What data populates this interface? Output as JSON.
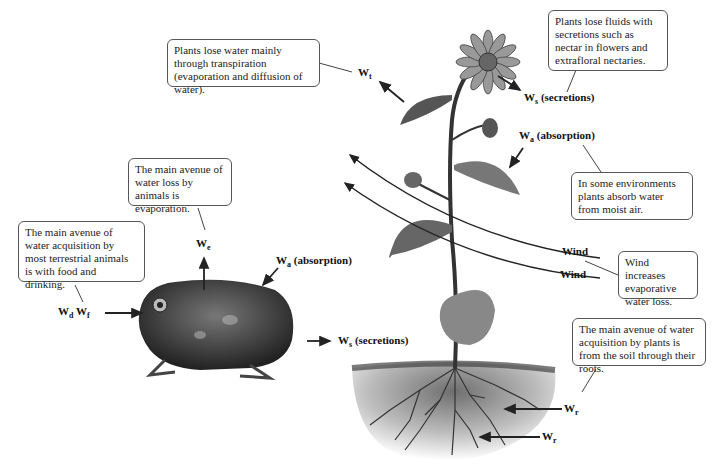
{
  "callouts": {
    "transpiration": "Plants lose water mainly through transpiration (evaporation and diffusion of water).",
    "plant_secretions": "Plants lose fluids with secretions such as nectar in flowers and extrafloral nectaries.",
    "plant_absorption": "In some environments plants absorb water from moist air.",
    "animal_evaporation": "The main avenue of water loss by animals is evaporation.",
    "animal_acquisition": "The main avenue of water acquisition by most terrestrial animals is with food and drinking.",
    "wind": "Wind increases evaporative water loss.",
    "plant_roots": "The main avenue of water acquisition by plants is from the soil through their roots."
  },
  "labels": {
    "W": "W",
    "t": "t",
    "s": "s",
    "a": "a",
    "e": "e",
    "d": "d",
    "f": "f",
    "r": "r",
    "secretions": " (secretions)",
    "absorption": " (absorption)",
    "wind": "Wind"
  },
  "icons": {
    "plant": "sunflower-plant-illustration",
    "animal": "toad-illustration",
    "soil": "soil-roots-illustration"
  },
  "colors": {
    "line": "#222222",
    "box_border": "#555555",
    "soil": "#8a8a8a"
  }
}
